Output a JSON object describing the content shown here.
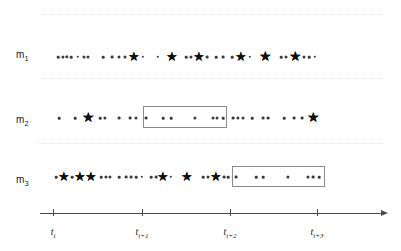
{
  "figure": {
    "type": "event-timeline",
    "background_color": "#ffffff",
    "marker_color": "#101010",
    "circle_color": "#3a3a3a",
    "gridline_color": "#e6e6e8",
    "axis_color": "#4a4a4a",
    "window_border_color": "#8a8a8a"
  },
  "gridlines": [
    {
      "name": "gridline-top",
      "y": 14
    },
    {
      "name": "gridline-m1-m2",
      "y": 78
    },
    {
      "name": "gridline-m2-m3",
      "y": 143
    }
  ],
  "rows": [
    {
      "id": "m1",
      "label": "m",
      "label_sub": "1",
      "label_x": 16,
      "label_y": 55,
      "track_y": 57,
      "window": null,
      "events": [
        {
          "type": "circle",
          "x": 58,
          "size": 2.6
        },
        {
          "type": "circle",
          "x": 63,
          "size": 3.2
        },
        {
          "type": "circle",
          "x": 67,
          "size": 3.4
        },
        {
          "type": "circle",
          "x": 71,
          "size": 2.6
        },
        {
          "type": "circle",
          "x": 78,
          "size": 2.4
        },
        {
          "type": "circle",
          "x": 84,
          "size": 3.0
        },
        {
          "type": "circle",
          "x": 88,
          "size": 3.0
        },
        {
          "type": "circle",
          "x": 103,
          "size": 2.6
        },
        {
          "type": "circle",
          "x": 112,
          "size": 2.8
        },
        {
          "type": "circle",
          "x": 119,
          "size": 3.0
        },
        {
          "type": "circle",
          "x": 125,
          "size": 3.0
        },
        {
          "type": "star",
          "x": 134,
          "size": 13
        },
        {
          "type": "circle",
          "x": 143,
          "size": 2.4
        },
        {
          "type": "circle",
          "x": 158,
          "size": 2.4
        },
        {
          "type": "star",
          "x": 172,
          "size": 13
        },
        {
          "type": "circle",
          "x": 186,
          "size": 2.6
        },
        {
          "type": "circle",
          "x": 191,
          "size": 3.2
        },
        {
          "type": "star",
          "x": 199,
          "size": 13
        },
        {
          "type": "circle",
          "x": 207,
          "size": 2.8
        },
        {
          "type": "circle",
          "x": 216,
          "size": 2.6
        },
        {
          "type": "circle",
          "x": 223,
          "size": 2.8
        },
        {
          "type": "circle",
          "x": 232,
          "size": 2.6
        },
        {
          "type": "star",
          "x": 241,
          "size": 13
        },
        {
          "type": "circle",
          "x": 250,
          "size": 2.4
        },
        {
          "type": "star",
          "x": 265,
          "size": 14
        },
        {
          "type": "circle",
          "x": 281,
          "size": 2.6
        },
        {
          "type": "circle",
          "x": 286,
          "size": 3.0
        },
        {
          "type": "star",
          "x": 295,
          "size": 14
        },
        {
          "type": "circle",
          "x": 304,
          "size": 3.0
        },
        {
          "type": "circle",
          "x": 309,
          "size": 2.6
        },
        {
          "type": "circle",
          "x": 315,
          "size": 2.4
        }
      ]
    },
    {
      "id": "m2",
      "label": "m",
      "label_sub": "2",
      "label_x": 16,
      "label_y": 120,
      "track_y": 118,
      "window": {
        "name": "highlight-window-m2",
        "x1": 143,
        "x2": 227,
        "y": 106,
        "height": 22
      },
      "events": [
        {
          "type": "circle",
          "x": 59,
          "size": 2.6
        },
        {
          "type": "circle",
          "x": 75,
          "size": 2.6
        },
        {
          "type": "star",
          "x": 88,
          "size": 14
        },
        {
          "type": "circle",
          "x": 100,
          "size": 2.6
        },
        {
          "type": "circle",
          "x": 105,
          "size": 3.2
        },
        {
          "type": "circle",
          "x": 119,
          "size": 2.8
        },
        {
          "type": "circle",
          "x": 130,
          "size": 2.8
        },
        {
          "type": "circle",
          "x": 136,
          "size": 3.0
        },
        {
          "type": "circle",
          "x": 146,
          "size": 2.8
        },
        {
          "type": "circle",
          "x": 163,
          "size": 2.6
        },
        {
          "type": "circle",
          "x": 171,
          "size": 2.6
        },
        {
          "type": "circle",
          "x": 195,
          "size": 3.2
        },
        {
          "type": "circle",
          "x": 213,
          "size": 3.0
        },
        {
          "type": "circle",
          "x": 217,
          "size": 3.0
        },
        {
          "type": "circle",
          "x": 223,
          "size": 2.6
        },
        {
          "type": "circle",
          "x": 233,
          "size": 2.8
        },
        {
          "type": "circle",
          "x": 238,
          "size": 3.2
        },
        {
          "type": "circle",
          "x": 243,
          "size": 3.0
        },
        {
          "type": "circle",
          "x": 252,
          "size": 2.6
        },
        {
          "type": "circle",
          "x": 263,
          "size": 2.8
        },
        {
          "type": "circle",
          "x": 268,
          "size": 2.8
        },
        {
          "type": "circle",
          "x": 284,
          "size": 2.6
        },
        {
          "type": "circle",
          "x": 294,
          "size": 2.8
        },
        {
          "type": "circle",
          "x": 302,
          "size": 2.8
        },
        {
          "type": "star",
          "x": 313,
          "size": 14
        }
      ]
    },
    {
      "id": "m3",
      "label": "m",
      "label_sub": "3",
      "label_x": 16,
      "label_y": 180,
      "track_y": 177,
      "window": {
        "name": "highlight-window-m3",
        "x1": 232,
        "x2": 325,
        "y": 166,
        "height": 21
      },
      "events": [
        {
          "type": "circle",
          "x": 56,
          "size": 2.6
        },
        {
          "type": "star",
          "x": 64,
          "size": 13
        },
        {
          "type": "circle",
          "x": 72,
          "size": 2.6
        },
        {
          "type": "star",
          "x": 80,
          "size": 13
        },
        {
          "type": "star",
          "x": 91,
          "size": 13
        },
        {
          "type": "circle",
          "x": 101,
          "size": 2.6
        },
        {
          "type": "circle",
          "x": 106,
          "size": 3.2
        },
        {
          "type": "circle",
          "x": 110,
          "size": 3.2
        },
        {
          "type": "circle",
          "x": 119,
          "size": 2.6
        },
        {
          "type": "circle",
          "x": 126,
          "size": 2.8
        },
        {
          "type": "circle",
          "x": 131,
          "size": 2.8
        },
        {
          "type": "circle",
          "x": 136,
          "size": 2.6
        },
        {
          "type": "circle",
          "x": 142,
          "size": 2.4
        },
        {
          "type": "circle",
          "x": 151,
          "size": 2.6
        },
        {
          "type": "circle",
          "x": 156,
          "size": 2.8
        },
        {
          "type": "star",
          "x": 163,
          "size": 13
        },
        {
          "type": "circle",
          "x": 171,
          "size": 2.4
        },
        {
          "type": "star",
          "x": 187,
          "size": 13
        },
        {
          "type": "circle",
          "x": 203,
          "size": 2.6
        },
        {
          "type": "circle",
          "x": 208,
          "size": 3.0
        },
        {
          "type": "star",
          "x": 216,
          "size": 13
        },
        {
          "type": "circle",
          "x": 224,
          "size": 2.8
        },
        {
          "type": "circle",
          "x": 228,
          "size": 2.6
        },
        {
          "type": "circle",
          "x": 236,
          "size": 2.8
        },
        {
          "type": "circle",
          "x": 256,
          "size": 2.6
        },
        {
          "type": "circle",
          "x": 263,
          "size": 2.6
        },
        {
          "type": "circle",
          "x": 288,
          "size": 3.2
        },
        {
          "type": "circle",
          "x": 308,
          "size": 3.0
        },
        {
          "type": "circle",
          "x": 313,
          "size": 2.8
        },
        {
          "type": "circle",
          "x": 319,
          "size": 2.6
        }
      ]
    }
  ],
  "axis": {
    "name": "time-axis",
    "y": 213,
    "x_start": 40,
    "x_end": 381,
    "tick_height": 7,
    "ticks": [
      {
        "label": "t",
        "sub": "i",
        "x": 53
      },
      {
        "label": "t",
        "sub": "i+1",
        "x": 142
      },
      {
        "label": "t",
        "sub": "i+2",
        "x": 230
      },
      {
        "label": "t",
        "sub": "i+3",
        "x": 317
      }
    ],
    "label_y": 226
  },
  "chart_data": {
    "type": "scatter",
    "title": "",
    "xlabel": "",
    "ylabel": "",
    "legend": [
      {
        "marker": "circle",
        "meaning": "event"
      },
      {
        "marker": "star",
        "meaning": "salient event"
      },
      {
        "marker": "rectangle",
        "meaning": "highlighted time window"
      }
    ],
    "categories": [
      "m1",
      "m2",
      "m3"
    ],
    "xtick_labels": [
      "t_i",
      "t_i+1",
      "t_i+2",
      "t_i+3"
    ],
    "grid": false
  }
}
